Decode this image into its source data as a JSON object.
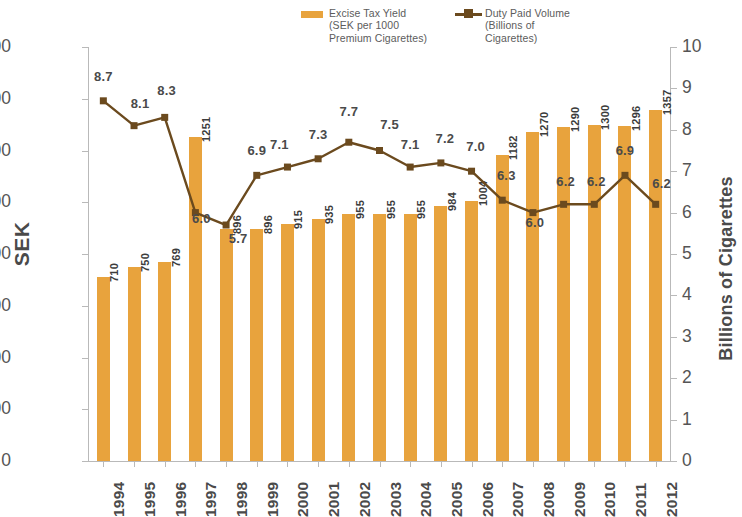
{
  "legend": {
    "bar": {
      "label": "Excise Tax Yield\n(SEK per 1000\nPremium Cigarettes)",
      "color": "#E8A33D",
      "marker": "filled-rectangle"
    },
    "line": {
      "label": "Duty Paid Volume\n(Billions of\nCigarettes)",
      "color": "#6B4A1E",
      "marker": "line-with-square"
    }
  },
  "axes": {
    "left_title": "SEK",
    "right_title": "Billions of Cigarettes",
    "left_ticks": [
      "1600",
      "1400",
      "1200",
      "1000",
      "800",
      "600",
      "400",
      "200",
      "0"
    ],
    "right_ticks": [
      "10",
      "9",
      "8",
      "7",
      "6",
      "5",
      "4",
      "3",
      "2",
      "1",
      "0"
    ]
  },
  "chart_data": {
    "type": "bar",
    "title": "",
    "xlabel": "",
    "ylabel": "SEK",
    "y2label": "Billions of Cigarettes",
    "ylim": [
      0,
      1600
    ],
    "y2lim": [
      0,
      10
    ],
    "grid": false,
    "legend_position": "top",
    "categories": [
      "1994",
      "1995",
      "1996",
      "1997",
      "1998",
      "1999",
      "2000",
      "2001",
      "2002",
      "2003",
      "2004",
      "2005",
      "2006",
      "2007",
      "2008",
      "2009",
      "2010",
      "2011",
      "2012"
    ],
    "series": [
      {
        "name": "Excise Tax Yield (SEK per 1000 Premium Cigarettes)",
        "type": "bar",
        "axis": "left",
        "color": "#E8A33D",
        "values": [
          710,
          750,
          769,
          1251,
          896,
          896,
          915,
          935,
          955,
          955,
          955,
          984,
          1004,
          1182,
          1270,
          1290,
          1300,
          1296,
          1357
        ],
        "labels": [
          "710",
          "750",
          "769",
          "1251",
          "896",
          "896",
          "915",
          "935",
          "955",
          "955",
          "955",
          "984",
          "1004",
          "1182",
          "1270",
          "1290",
          "1300",
          "1296",
          "1357"
        ]
      },
      {
        "name": "Duty Paid Volume (Billions of Cigarettes)",
        "type": "line",
        "axis": "right",
        "color": "#6B4A1E",
        "values": [
          8.7,
          8.1,
          8.3,
          6.0,
          5.7,
          6.9,
          7.1,
          7.3,
          7.7,
          7.5,
          7.1,
          7.2,
          7.0,
          6.3,
          6.0,
          6.2,
          6.2,
          6.9,
          6.2
        ],
        "labels": [
          "8.7",
          "8.1",
          "8.3",
          "6.0",
          "5.7",
          "6.9",
          "7.1",
          "7.3",
          "7.7",
          "7.5",
          "7.1",
          "7.2",
          "7.0",
          "6.3",
          "6.0",
          "6.2",
          "6.2",
          "6.9",
          "6.2"
        ]
      }
    ]
  }
}
